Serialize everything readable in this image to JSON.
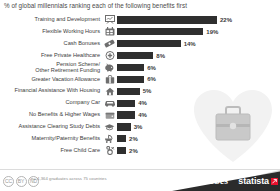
{
  "title": "% of global millennials ranking each of the following benefits first",
  "footer": {
    "note": "n= 4,364 graduates across 75 countries",
    "license_badges": [
      "CC",
      "BY",
      "ND"
    ],
    "brand_primary": "Forbes",
    "brand_secondary": "statista",
    "brand_mark": "statista-logo-mark",
    "accent_color": "#e8112d",
    "bar_color": "#2f2f2f"
  },
  "chart_data": {
    "type": "bar",
    "orientation": "horizontal",
    "title": "% of global millennials ranking each of the following benefits first",
    "xlabel": "",
    "ylabel": "",
    "xlim": [
      0,
      22
    ],
    "grid": false,
    "legend": false,
    "value_suffix": "%",
    "categories": [
      "Training and Development",
      "Flexible Working Hours",
      "Cash Bonuses",
      "Free Private Healthcare",
      "Pension Scheme/\nOther Retirement Funding",
      "Greater Vacation Allowance",
      "Financial Assistance With Housing",
      "Company Car",
      "No Benefits & Higher Wages",
      "Assistance Clearing Study Debts",
      "Maternity/Paternity Benefits",
      "Free Child Care"
    ],
    "values": [
      22,
      19,
      14,
      8,
      6,
      6,
      5,
      4,
      4,
      3,
      2,
      2
    ],
    "value_labels": [
      "22%",
      "19%",
      "14%",
      "8%",
      "6%",
      "6%",
      "5%",
      "4%",
      "4%",
      "3%",
      "2%",
      "2%"
    ],
    "icons": [
      "presentation-board-icon",
      "calendar-icon",
      "money-banknote-icon",
      "medical-cross-icon",
      "piggy-bank-icon",
      "suitcase-icon",
      "house-icon",
      "car-icon",
      "wallet-icon",
      "graduation-cap-icon",
      "baby-stroller-icon",
      "pacifier-icon"
    ]
  },
  "watermark": {
    "name": "heart-with-briefcase-illustration"
  }
}
